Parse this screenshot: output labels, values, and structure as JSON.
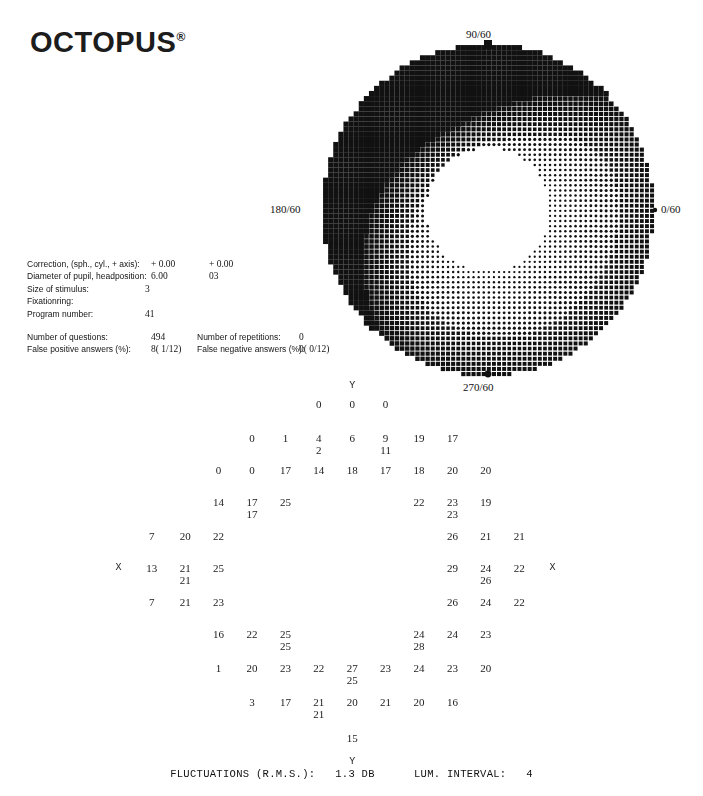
{
  "brand": {
    "name": "OCTOPUS",
    "registered": "®"
  },
  "greyscale": {
    "axis_labels": {
      "top": "90/60",
      "left": "180/60",
      "right": "0/60",
      "bottom": "270/60"
    },
    "colors": {
      "ink": "#111111",
      "paper": "#ffffff"
    }
  },
  "params": {
    "rows": [
      {
        "label": "Correction, (sph., cyl., + axis):",
        "value": "+ 0.00",
        "value2": "+ 0.00"
      },
      {
        "label": "Diameter of pupil, headposition:",
        "value": "6.00",
        "value2": "03"
      },
      {
        "label": "Size of stimulus:",
        "value": "3",
        "value2": ""
      },
      {
        "label": "Fixationring:",
        "value": "",
        "value2": ""
      },
      {
        "label": "Program number:",
        "value": "41",
        "value2": ""
      }
    ],
    "stats": [
      {
        "label": "Number of questions:",
        "value": "494",
        "label2": "Number of repetitions:",
        "value2": "0"
      },
      {
        "label": "False positive answers (%):",
        "value": "8( 1/12)",
        "label2": "False negative answers (%):",
        "value2": "0( 0/12)"
      }
    ]
  },
  "value_grid": {
    "top_marker": "Y",
    "bottom_marker": "Y",
    "blind_spot_marker": "X",
    "rows": [
      {
        "y": 6,
        "cells": [
          {
            "c": 8,
            "v": "Y",
            "t": "marker"
          }
        ]
      },
      {
        "y": 24,
        "cells": [
          {
            "c": 7,
            "v": "0"
          },
          {
            "c": 8,
            "v": "0"
          },
          {
            "c": 9,
            "v": "0"
          }
        ]
      },
      {
        "y": 58,
        "cells": [
          {
            "c": 5,
            "v": "0"
          },
          {
            "c": 6,
            "v": "1"
          },
          {
            "c": 7,
            "v": "4",
            "s": "2"
          },
          {
            "c": 8,
            "v": "6"
          },
          {
            "c": 9,
            "v": "9",
            "s": "11"
          },
          {
            "c": 10,
            "v": "19"
          },
          {
            "c": 11,
            "v": "17"
          }
        ]
      },
      {
        "y": 90,
        "cells": [
          {
            "c": 4,
            "v": "0"
          },
          {
            "c": 5,
            "v": "0"
          },
          {
            "c": 6,
            "v": "17"
          },
          {
            "c": 7,
            "v": "14"
          },
          {
            "c": 8,
            "v": "18"
          },
          {
            "c": 9,
            "v": "17"
          },
          {
            "c": 10,
            "v": "18"
          },
          {
            "c": 11,
            "v": "20"
          },
          {
            "c": 12,
            "v": "20"
          }
        ]
      },
      {
        "y": 122,
        "cells": [
          {
            "c": 4,
            "v": "14"
          },
          {
            "c": 5,
            "v": "17",
            "s": "17"
          },
          {
            "c": 6,
            "v": "25"
          },
          {
            "c": 10,
            "v": "22"
          },
          {
            "c": 11,
            "v": "23",
            "s": "23"
          },
          {
            "c": 12,
            "v": "19"
          }
        ]
      },
      {
        "y": 156,
        "cells": [
          {
            "c": 2,
            "v": "7"
          },
          {
            "c": 3,
            "v": "20"
          },
          {
            "c": 4,
            "v": "22"
          },
          {
            "c": 11,
            "v": "26"
          },
          {
            "c": 12,
            "v": "21"
          },
          {
            "c": 13,
            "v": "21"
          }
        ]
      },
      {
        "y": 188,
        "cells": [
          {
            "c": 1,
            "v": "X",
            "t": "marker"
          },
          {
            "c": 2,
            "v": "13"
          },
          {
            "c": 3,
            "v": "21",
            "s": "21"
          },
          {
            "c": 4,
            "v": "25"
          },
          {
            "c": 11,
            "v": "29"
          },
          {
            "c": 12,
            "v": "24",
            "s": "26"
          },
          {
            "c": 13,
            "v": "22"
          },
          {
            "c": 14,
            "v": "X",
            "t": "marker"
          }
        ]
      },
      {
        "y": 222,
        "cells": [
          {
            "c": 2,
            "v": "7"
          },
          {
            "c": 3,
            "v": "21"
          },
          {
            "c": 4,
            "v": "23"
          },
          {
            "c": 11,
            "v": "26"
          },
          {
            "c": 12,
            "v": "24"
          },
          {
            "c": 13,
            "v": "22"
          }
        ]
      },
      {
        "y": 254,
        "cells": [
          {
            "c": 4,
            "v": "16"
          },
          {
            "c": 5,
            "v": "22"
          },
          {
            "c": 6,
            "v": "25",
            "s": "25"
          },
          {
            "c": 10,
            "v": "24",
            "s": "28"
          },
          {
            "c": 11,
            "v": "24"
          },
          {
            "c": 12,
            "v": "23"
          }
        ]
      },
      {
        "y": 288,
        "cells": [
          {
            "c": 4,
            "v": "1"
          },
          {
            "c": 5,
            "v": "20"
          },
          {
            "c": 6,
            "v": "23"
          },
          {
            "c": 7,
            "v": "22"
          },
          {
            "c": 8,
            "v": "27",
            "s": "25"
          },
          {
            "c": 9,
            "v": "23"
          },
          {
            "c": 10,
            "v": "24"
          },
          {
            "c": 11,
            "v": "23"
          },
          {
            "c": 12,
            "v": "20"
          }
        ]
      },
      {
        "y": 322,
        "cells": [
          {
            "c": 5,
            "v": "3"
          },
          {
            "c": 6,
            "v": "17"
          },
          {
            "c": 7,
            "v": "21",
            "s": "21"
          },
          {
            "c": 8,
            "v": "20"
          },
          {
            "c": 9,
            "v": "21"
          },
          {
            "c": 10,
            "v": "20"
          },
          {
            "c": 11,
            "v": "16"
          }
        ]
      },
      {
        "y": 358,
        "cells": [
          {
            "c": 8,
            "v": "15"
          }
        ]
      },
      {
        "y": 382,
        "cells": [
          {
            "c": 8,
            "v": "Y",
            "t": "marker"
          }
        ]
      }
    ]
  },
  "footer": {
    "fluctuations_label": "FLUCTUATIONS (R.M.S.):",
    "fluctuations_value": "1.3 DB",
    "lum_label": "LUM. INTERVAL:",
    "lum_value": "4"
  }
}
